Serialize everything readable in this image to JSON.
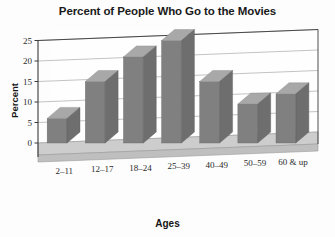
{
  "chart_data": {
    "type": "bar",
    "title": "Percent of People Who Go to the Movies",
    "xlabel": "Ages",
    "ylabel": "Percent",
    "categories": [
      "2–11",
      "12–17",
      "18–24",
      "25–39",
      "40–49",
      "50–59",
      "60 & up"
    ],
    "values": [
      6,
      15,
      21,
      25,
      15,
      9.5,
      12
    ],
    "ylim": [
      0,
      25
    ],
    "yticks": [
      0,
      5,
      10,
      15,
      20,
      25
    ],
    "ytick_labels": [
      "0",
      "5",
      "10",
      "15",
      "20",
      "25"
    ],
    "grid": true,
    "grid_axis": "y",
    "legend": false,
    "style": "3d-perspective",
    "colors": {
      "bar_front": "#808080",
      "bar_top": "#a8a8a8",
      "bar_side": "#6e6e6e",
      "floor": "#c9c9c9",
      "grid_line": "#9a9a9a",
      "axis_line": "#3a3a3a",
      "background": "#fdfdfd",
      "text": "#1a1a1a"
    }
  }
}
